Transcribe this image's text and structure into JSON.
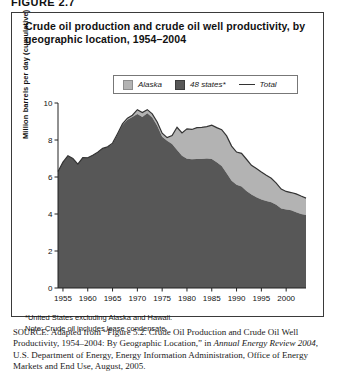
{
  "figure_label": "FIGURE 2.7",
  "chart_title": "Crude oil production and crude oil well productivity, by geographic location, 1954–2004",
  "legend": {
    "items": [
      {
        "label": "Alaska",
        "marker": "swatch-light-gray",
        "color": "#b3b3b3"
      },
      {
        "label": "48 states*",
        "marker": "swatch-dark-gray",
        "color": "#575757"
      },
      {
        "label": "Total",
        "marker": "line",
        "color": "#333333"
      }
    ]
  },
  "footnotes": {
    "asterisk": "*United States excluding Alaska and Hawaii.",
    "note": "Note: Crude oil includes lease condensate."
  },
  "source": {
    "caption": "SOURCE:",
    "text_1": " Adapted from “Figure 5.2. Crude Oil Production and Crude Oil Well Productivity, 1954–2004: By Geographic Location,” in ",
    "italic_1": "Annual Energy Review 2004",
    "text_2": ", U.S. Department of Energy, Energy Information Administration, Office of Energy Markets and End Use, August, 2005."
  },
  "chart_data": {
    "type": "area",
    "title": "Crude oil production and crude oil well productivity, by geographic location, 1954–2004",
    "xlabel": "",
    "ylabel": "Million barrels per day (cumulative)",
    "xlim": [
      1954,
      2004
    ],
    "ylim": [
      0,
      10
    ],
    "ytick_labels": [
      "0",
      "2",
      "4",
      "6",
      "8",
      "10"
    ],
    "yticks": [
      0,
      2,
      4,
      6,
      8,
      10
    ],
    "xtick_labels": [
      "1955",
      "1960",
      "1965",
      "1970",
      "1975",
      "1980",
      "1985",
      "1990",
      "1995",
      "2000"
    ],
    "xticks": [
      1955,
      1960,
      1965,
      1970,
      1975,
      1980,
      1985,
      1990,
      1995,
      2000
    ],
    "grid": false,
    "legend_position": "above-plot",
    "stacked": true,
    "x": [
      1954,
      1955,
      1956,
      1957,
      1958,
      1959,
      1960,
      1961,
      1962,
      1963,
      1964,
      1965,
      1966,
      1967,
      1968,
      1969,
      1970,
      1971,
      1972,
      1973,
      1974,
      1975,
      1976,
      1977,
      1978,
      1979,
      1980,
      1981,
      1982,
      1983,
      1984,
      1985,
      1986,
      1987,
      1988,
      1989,
      1990,
      1991,
      1992,
      1993,
      1994,
      1995,
      1996,
      1997,
      1998,
      1999,
      2000,
      2001,
      2002,
      2003,
      2004
    ],
    "series": [
      {
        "name": "48 states*",
        "color": "#575757",
        "values": [
          6.3,
          6.8,
          7.15,
          7.0,
          6.7,
          7.05,
          7.04,
          7.18,
          7.33,
          7.54,
          7.61,
          7.8,
          8.3,
          8.81,
          9.1,
          9.24,
          9.41,
          9.24,
          9.44,
          9.21,
          8.77,
          8.18,
          7.96,
          7.78,
          7.46,
          7.15,
          6.98,
          6.96,
          6.97,
          6.97,
          7.0,
          6.97,
          6.8,
          6.6,
          6.2,
          5.8,
          5.58,
          5.48,
          5.25,
          5.05,
          4.9,
          4.79,
          4.7,
          4.63,
          4.5,
          4.3,
          4.25,
          4.2,
          4.1,
          4.0,
          3.95
        ]
      },
      {
        "name": "Alaska",
        "color": "#b3b3b3",
        "values": [
          0.0,
          0.0,
          0.0,
          0.0,
          0.0,
          0.0,
          0.0,
          0.0,
          0.01,
          0.01,
          0.02,
          0.03,
          0.04,
          0.06,
          0.08,
          0.1,
          0.23,
          0.24,
          0.2,
          0.2,
          0.2,
          0.19,
          0.17,
          0.46,
          1.23,
          1.23,
          1.62,
          1.61,
          1.7,
          1.71,
          1.72,
          1.83,
          1.87,
          1.96,
          2.02,
          1.87,
          1.77,
          1.8,
          1.71,
          1.58,
          1.56,
          1.48,
          1.39,
          1.3,
          1.17,
          1.05,
          0.97,
          0.96,
          0.99,
          0.97,
          0.91
        ]
      }
    ],
    "total_line": {
      "name": "Total",
      "color": "#333333",
      "values": [
        6.3,
        6.8,
        7.15,
        7.0,
        6.7,
        7.05,
        7.04,
        7.18,
        7.34,
        7.55,
        7.63,
        7.83,
        8.34,
        8.87,
        9.18,
        9.34,
        9.64,
        9.48,
        9.64,
        9.41,
        8.97,
        8.37,
        8.13,
        8.24,
        8.69,
        8.38,
        8.6,
        8.57,
        8.67,
        8.68,
        8.72,
        8.8,
        8.67,
        8.56,
        8.22,
        7.67,
        7.35,
        7.28,
        6.96,
        6.63,
        6.46,
        6.27,
        6.09,
        5.93,
        5.67,
        5.35,
        5.22,
        5.16,
        5.09,
        4.97,
        4.86
      ]
    }
  }
}
